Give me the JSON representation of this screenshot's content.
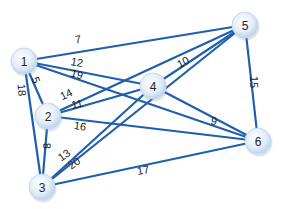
{
  "diagram": {
    "type": "weighted-undirected-graph",
    "colors": {
      "edge": "#1f5fae",
      "node_fill_center": "#ffffff",
      "node_fill_edge": "#bcd3ec",
      "text": "#222222"
    },
    "nodes": [
      {
        "id": "1",
        "label": "1",
        "x": 24,
        "y": 61
      },
      {
        "id": "2",
        "label": "2",
        "x": 48,
        "y": 116
      },
      {
        "id": "3",
        "label": "3",
        "x": 42,
        "y": 187
      },
      {
        "id": "4",
        "label": "4",
        "x": 153,
        "y": 86
      },
      {
        "id": "5",
        "label": "5",
        "x": 245,
        "y": 25
      },
      {
        "id": "6",
        "label": "6",
        "x": 258,
        "y": 141
      }
    ],
    "edges": [
      {
        "from": "1",
        "to": "5",
        "weight": "7",
        "lx": 78,
        "ly": 39,
        "rot": -8
      },
      {
        "from": "1",
        "to": "4",
        "weight": "12",
        "lx": 77,
        "ly": 62,
        "rot": 10
      },
      {
        "from": "1",
        "to": "6",
        "weight": "19",
        "lx": 77,
        "ly": 74,
        "rot": 18
      },
      {
        "from": "1",
        "to": "2",
        "weight": "5",
        "lx": 36,
        "ly": 80,
        "rot": 70
      },
      {
        "from": "1",
        "to": "3",
        "weight": "18",
        "lx": 22,
        "ly": 90,
        "rot": 85
      },
      {
        "from": "2",
        "to": "5",
        "weight": "14",
        "lx": 66,
        "ly": 94,
        "rot": -25
      },
      {
        "from": "2",
        "to": "4",
        "weight": "11",
        "lx": 77,
        "ly": 104,
        "rot": -12
      },
      {
        "from": "2",
        "to": "6",
        "weight": "16",
        "lx": 80,
        "ly": 126,
        "rot": 8
      },
      {
        "from": "2",
        "to": "3",
        "weight": "8",
        "lx": 47,
        "ly": 146,
        "rot": 88
      },
      {
        "from": "3",
        "to": "4",
        "weight": "13",
        "lx": 64,
        "ly": 155,
        "rot": -35
      },
      {
        "from": "3",
        "to": "5",
        "weight": "20",
        "lx": 74,
        "ly": 163,
        "rot": -35
      },
      {
        "from": "3",
        "to": "6",
        "weight": "17",
        "lx": 143,
        "ly": 170,
        "rot": -10
      },
      {
        "from": "4",
        "to": "5",
        "weight": "10",
        "lx": 183,
        "ly": 62,
        "rot": -28
      },
      {
        "from": "4",
        "to": "6",
        "weight": "9",
        "lx": 214,
        "ly": 121,
        "rot": 15
      },
      {
        "from": "5",
        "to": "6",
        "weight": "15",
        "lx": 254,
        "ly": 82,
        "rot": 90
      }
    ]
  }
}
